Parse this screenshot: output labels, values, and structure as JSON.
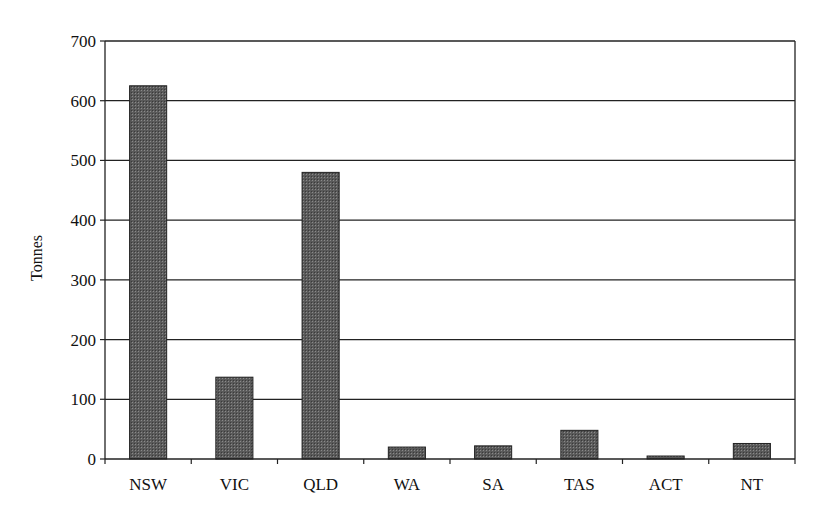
{
  "chart_data": {
    "type": "bar",
    "title": "",
    "xlabel": "",
    "ylabel": "Tonnes",
    "categories": [
      "NSW",
      "VIC",
      "QLD",
      "WA",
      "SA",
      "TAS",
      "ACT",
      "NT"
    ],
    "values": [
      625,
      137,
      480,
      20,
      22,
      48,
      5,
      26
    ],
    "ylim": [
      0,
      700
    ],
    "yticks": [
      0,
      100,
      200,
      300,
      400,
      500,
      600,
      700
    ],
    "grid": true,
    "legend": null,
    "bar_color": "#555555"
  }
}
